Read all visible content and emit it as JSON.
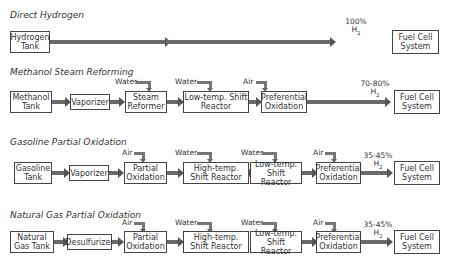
{
  "diagram": {
    "rows": [
      {
        "title": "Direct Hydrogen",
        "source": "Hydrogen Tank",
        "steps": [],
        "output_pct": "100%",
        "output_gas": "H",
        "output_sub": "2",
        "destination": "Fuel Cell System"
      },
      {
        "title": "Methanol Steam Reforming",
        "source": "Methanol Tank",
        "steps": [
          {
            "label": "Vaporizer",
            "feed": ""
          },
          {
            "label": "Steam Reformer",
            "feed": "Water"
          },
          {
            "label": "Low-temp. Shift Reactor",
            "feed": "Water"
          },
          {
            "label": "Preferential Oxidation",
            "feed": "Air"
          }
        ],
        "output_pct": "70-80%",
        "output_gas": "H",
        "output_sub": "2",
        "destination": "Fuel Cell System"
      },
      {
        "title": "Gasoline Partial Oxidation",
        "source": "Gasoline Tank",
        "steps": [
          {
            "label": "Vaporizer",
            "feed": ""
          },
          {
            "label": "Partial Oxidation",
            "feed": "Air"
          },
          {
            "label": "High-temp. Shift Reactor",
            "feed": "Water"
          },
          {
            "label": "Low-temp. Shift Reactor",
            "feed": "Water"
          },
          {
            "label": "Preferential Oxidation",
            "feed": "Air"
          }
        ],
        "output_pct": "35-45%",
        "output_gas": "H",
        "output_sub": "2",
        "destination": "Fuel Cell System"
      },
      {
        "title": "Natural Gas Partial Oxidation",
        "source": "Natural Gas Tank",
        "steps": [
          {
            "label": "Desulfurizer",
            "feed": ""
          },
          {
            "label": "Partial Oxidation",
            "feed": "Air"
          },
          {
            "label": "High-temp. Shift Reactor",
            "feed": "Water"
          },
          {
            "label": "Low-temp. Shift Reactor",
            "feed": "Water"
          },
          {
            "label": "Preferential Oxidation",
            "feed": "Air"
          }
        ],
        "output_pct": "35-45%",
        "output_gas": "H",
        "output_sub": "2",
        "destination": "Fuel Cell System"
      }
    ]
  }
}
